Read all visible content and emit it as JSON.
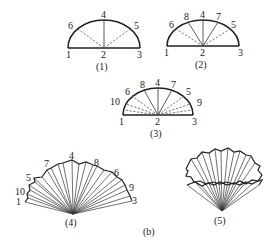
{
  "figure": {
    "group_caption": "(b)",
    "panels": [
      {
        "id": "1",
        "caption": "(1)",
        "description": "Semicircle divided into quarters; solid radius to 4, dashed radii to 6 and 5",
        "labels": [
          "1",
          "2",
          "3",
          "4",
          "5",
          "6"
        ]
      },
      {
        "id": "2",
        "caption": "(2)",
        "description": "Semicircle with solid radii to 8, 4, 7 and dashed radii to 6 and 5",
        "labels": [
          "1",
          "2",
          "3",
          "4",
          "5",
          "6",
          "7",
          "8"
        ]
      },
      {
        "id": "3",
        "caption": "(3)",
        "description": "Semicircle with solid radii to 8, 4, 7 and dashed radii to 10, 6, 5, 9 plus extra subdivisions",
        "labels": [
          "1",
          "2",
          "3",
          "4",
          "5",
          "6",
          "7",
          "8",
          "9",
          "10"
        ]
      },
      {
        "id": "4",
        "caption": "(4)",
        "description": "Pleated fan folded from semicircle",
        "labels": [
          "1",
          "10",
          "5",
          "7",
          "4",
          "8",
          "6",
          "9",
          "3"
        ]
      },
      {
        "id": "5",
        "caption": "(5)",
        "description": "Fan formed into a pleated cone/cup"
      }
    ]
  }
}
